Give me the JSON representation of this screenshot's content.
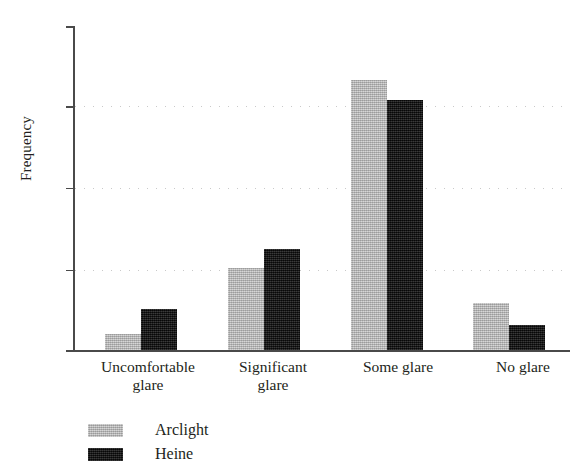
{
  "chart_data": {
    "type": "bar",
    "title": "",
    "subtitle": "",
    "xlabel": "",
    "ylabel": "Frequency",
    "categories": [
      "Uncomfortable glare",
      "Significant glare",
      "Some glare",
      "No glare"
    ],
    "category_lines": [
      [
        "Uncomfortable",
        "glare"
      ],
      [
        "Significant",
        "glare"
      ],
      [
        "Some glare",
        ""
      ],
      [
        "No glare",
        ""
      ]
    ],
    "series": [
      {
        "name": "Arclight",
        "color": "#b4b4b4",
        "values": [
          4,
          20,
          65.5,
          11.5
        ]
      },
      {
        "name": "Heine",
        "color": "#161616",
        "values": [
          10,
          24.5,
          60.5,
          6
        ]
      }
    ],
    "ylim": [
      0,
      80
    ],
    "yticks": [
      0,
      20,
      40,
      60,
      80
    ],
    "ytick_labels": [
      "0",
      "20",
      "40",
      "60",
      "80"
    ],
    "grid": "horizontal-dotted",
    "gridlines_at": [
      20,
      40,
      60
    ],
    "legend_position": "below-axis-left",
    "legend": [
      {
        "label": "Arclight",
        "color": "#b4b4b4"
      },
      {
        "label": "Heine",
        "color": "#161616"
      }
    ]
  },
  "axis": {
    "y_title": "Frequency",
    "tick_0": "0",
    "tick_20": "20",
    "tick_40": "40",
    "tick_60": "60",
    "tick_80": "80"
  },
  "categories_text": {
    "c0_line1": "Uncomfortable",
    "c0_line2": "glare",
    "c1_line1": "Significant",
    "c1_line2": "glare",
    "c2_line1": "Some glare",
    "c3_line1": "No glare"
  },
  "legend_text": {
    "arclight": "Arclight",
    "heine": "Heine"
  }
}
